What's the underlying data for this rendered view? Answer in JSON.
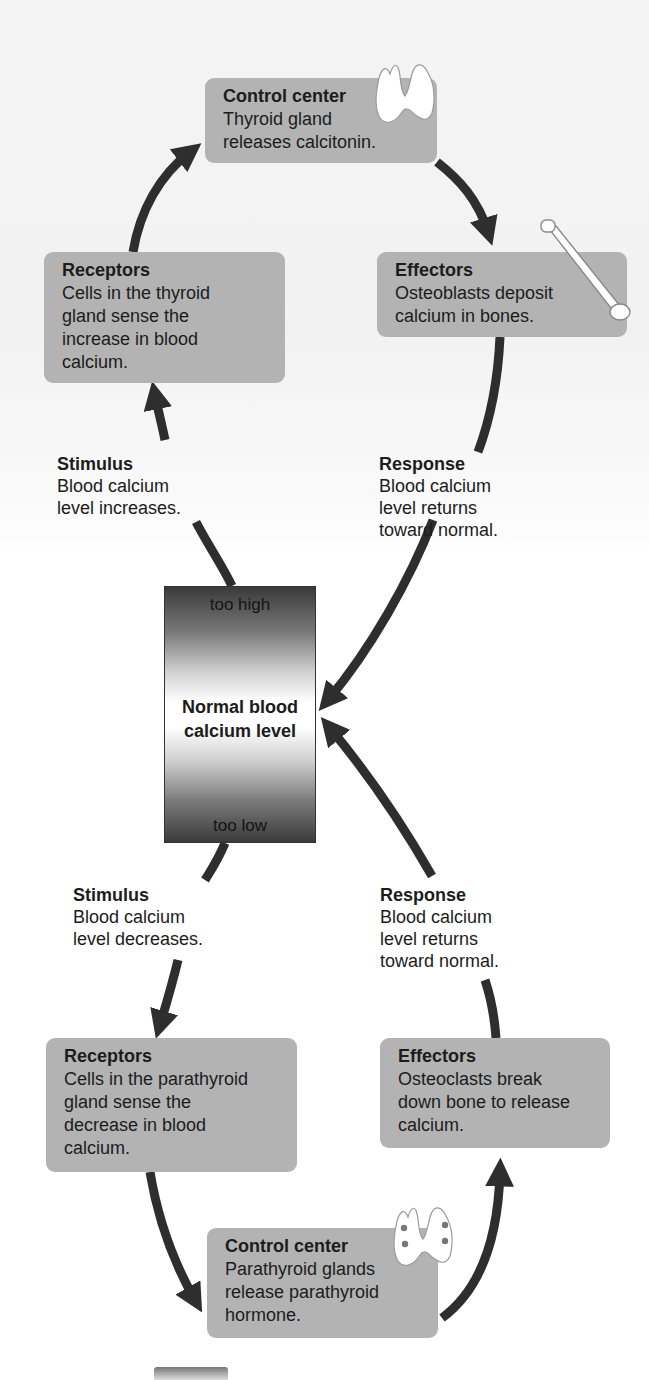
{
  "diagram": {
    "colors": {
      "box_fill": "#b3b3b3",
      "arrow": "#2e2e2e",
      "text": "#1c1c1c"
    },
    "upper_loop": {
      "control_center": {
        "title": "Control center",
        "body": "Thyroid gland\nreleases calcitonin.",
        "icon": "thyroid-gland-icon"
      },
      "receptors": {
        "title": "Receptors",
        "body": "Cells in the thyroid\ngland sense the\nincrease in blood\ncalcium."
      },
      "effectors": {
        "title": "Effectors",
        "body": "Osteoblasts deposit\ncalcium in bones.",
        "icon": "bone-icon"
      },
      "stimulus": {
        "title": "Stimulus",
        "body": "Blood calcium\nlevel increases."
      },
      "response": {
        "title": "Response",
        "body": "Blood calcium\nlevel returns\ntoward normal."
      }
    },
    "gauge": {
      "top_label": "too high",
      "center_label": "Normal blood\ncalcium level",
      "bottom_label": "too low"
    },
    "lower_loop": {
      "stimulus": {
        "title": "Stimulus",
        "body": "Blood calcium\nlevel decreases."
      },
      "response": {
        "title": "Response",
        "body": "Blood calcium\nlevel returns\ntoward normal."
      },
      "receptors": {
        "title": "Receptors",
        "body": "Cells in the parathyroid\ngland sense the\ndecrease in blood\ncalcium."
      },
      "effectors": {
        "title": "Effectors",
        "body": "Osteoclasts break\ndown bone to release\ncalcium."
      },
      "control_center": {
        "title": "Control center",
        "body": "Parathyroid glands\nrelease parathyroid\nhormone.",
        "icon": "parathyroid-glands-icon"
      }
    }
  }
}
